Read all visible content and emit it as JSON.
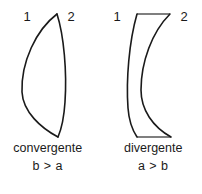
{
  "figure": {
    "background_color": "#ffffff",
    "stroke_color": "#1a1a1a",
    "cap_color": "#555555"
  },
  "lenses": [
    {
      "id": "convergent",
      "caption": "convergente",
      "relation": "b > a",
      "surface_labels": {
        "first": "1",
        "second": "2"
      },
      "shape": "biconvex-crescent"
    },
    {
      "id": "divergent",
      "caption": "divergente",
      "relation": "a > b",
      "surface_labels": {
        "first": "1",
        "second": "2"
      },
      "shape": "meniscus-concave"
    }
  ]
}
